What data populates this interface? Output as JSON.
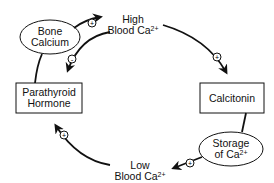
{
  "diagram": {
    "nodes": {
      "bone_calcium": {
        "line1": "Bone",
        "line2": "Calcium",
        "shape": "ellipse"
      },
      "high_blood_ca": {
        "line1": "High",
        "line2": "Blood Ca",
        "sup": "2+",
        "shape": "text"
      },
      "calcitonin": {
        "label": "Calcitonin",
        "shape": "box"
      },
      "storage": {
        "line1": "Storage",
        "line2": "of Ca",
        "sup": "2+",
        "shape": "ellipse"
      },
      "low_blood_ca": {
        "line1": "Low",
        "line2": "Blood Ca",
        "sup": "2+",
        "shape": "text"
      },
      "parathyroid": {
        "line1": "Parathyroid",
        "line2": "Hormone",
        "shape": "box"
      }
    },
    "edges": [
      {
        "from": "Bone Calcium",
        "to": "High Blood Ca2+",
        "sign": "+"
      },
      {
        "from": "High Blood Ca2+",
        "to": "Calcitonin",
        "sign": "+"
      },
      {
        "from": "Calcitonin",
        "to": "Storage of Ca2+",
        "sign": ""
      },
      {
        "from": "Storage of Ca2+",
        "to": "Low Blood Ca2+",
        "sign": "+"
      },
      {
        "from": "Low Blood Ca2+",
        "to": "Parathyroid Hormone",
        "sign": "+"
      },
      {
        "from": "Parathyroid Hormone",
        "to": "Bone Calcium",
        "sign": ""
      },
      {
        "from": "High Blood Ca2+",
        "to": "Parathyroid Hormone",
        "sign": "-"
      }
    ],
    "signs": {
      "plus": "+",
      "minus": "-"
    },
    "colors": {
      "line": "#111111",
      "background": "#ffffff"
    }
  }
}
